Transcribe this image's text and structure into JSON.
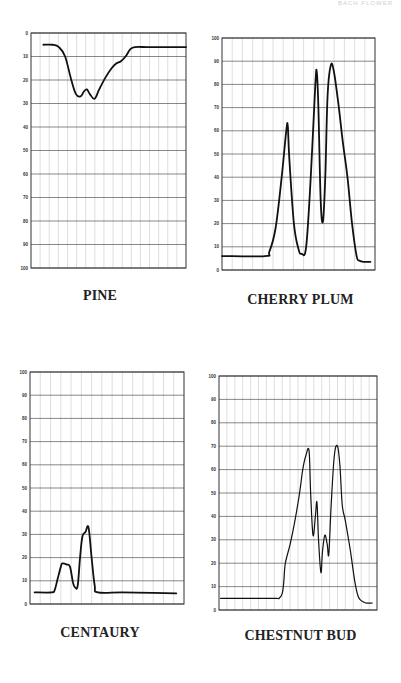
{
  "page": {
    "running_head": "BACH FLOWER"
  },
  "chart_data": [
    {
      "id": "pine",
      "type": "line",
      "title": "PINE",
      "xlabel": "",
      "ylabel": "",
      "ylim": [
        0,
        100
      ],
      "y_inverted": true,
      "y_ticks": [
        0,
        10,
        20,
        30,
        40,
        50,
        60,
        70,
        80,
        90,
        100
      ],
      "grid": true,
      "vertical_grid_columns": 17,
      "x": [
        8,
        14,
        18,
        22,
        26,
        29,
        32,
        34,
        36,
        38,
        41,
        44,
        48,
        52,
        55,
        58,
        61,
        64,
        67,
        75,
        85,
        100
      ],
      "values": [
        5,
        5,
        6,
        10,
        20,
        26,
        27,
        25,
        24,
        26,
        28,
        24,
        19,
        15,
        13,
        12,
        10,
        7,
        6,
        6,
        6,
        6
      ]
    },
    {
      "id": "cherry-plum",
      "type": "line",
      "title": "CHERRY PLUM",
      "xlabel": "",
      "ylabel": "",
      "ylim": [
        0,
        100
      ],
      "y_inverted": false,
      "y_ticks": [
        0,
        10,
        20,
        30,
        40,
        50,
        60,
        70,
        80,
        90,
        100
      ],
      "grid": true,
      "vertical_grid_columns": 15,
      "x": [
        0,
        28,
        31,
        35,
        39,
        42,
        43,
        44,
        47,
        50,
        52,
        55,
        58,
        61,
        62,
        63,
        64.5,
        66,
        67.5,
        69,
        71,
        73,
        76,
        79,
        82,
        85,
        88,
        90,
        93,
        97
      ],
      "values": [
        6,
        6,
        8,
        18,
        40,
        60,
        62,
        48,
        20,
        9,
        7,
        10,
        40,
        80,
        85,
        70,
        30,
        21,
        40,
        75,
        88,
        86,
        72,
        55,
        40,
        20,
        6,
        4,
        3.5,
        3.5
      ]
    },
    {
      "id": "centaury",
      "type": "line",
      "title": "CENTAURY",
      "xlabel": "",
      "ylabel": "",
      "ylim": [
        0,
        100
      ],
      "y_inverted": false,
      "y_ticks": [
        0,
        10,
        20,
        30,
        40,
        50,
        60,
        70,
        80,
        90,
        100
      ],
      "grid": true,
      "vertical_grid_columns": 15,
      "x": [
        3,
        14,
        16,
        18,
        20,
        21,
        24,
        26,
        28,
        29.5,
        31,
        32.5,
        34,
        36,
        38,
        40,
        42,
        44,
        60,
        80,
        95
      ],
      "values": [
        5,
        5,
        6,
        11,
        16,
        17.5,
        17,
        16,
        9,
        7,
        8,
        20,
        29,
        31,
        33,
        20,
        8,
        5,
        5,
        4.8,
        4.6
      ]
    },
    {
      "id": "chestnut-bud",
      "type": "line",
      "title": "CHESTNUT BUD",
      "xlabel": "",
      "ylabel": "",
      "ylim": [
        0,
        100
      ],
      "y_inverted": false,
      "y_ticks": [
        0,
        10,
        20,
        30,
        40,
        50,
        60,
        70,
        80,
        90,
        100
      ],
      "grid": true,
      "vertical_grid_columns": 20,
      "x": [
        1,
        20,
        36,
        38,
        40,
        41,
        42,
        45,
        48,
        51,
        53,
        55,
        57,
        58,
        59.5,
        61,
        62,
        63,
        64.5,
        65.5,
        67,
        68.5,
        69.5,
        71,
        73,
        75,
        76.5,
        78,
        80,
        83,
        86,
        88,
        90,
        93,
        97
      ],
      "values": [
        5,
        5,
        5,
        5,
        7,
        12,
        20,
        28,
        38,
        50,
        60,
        66,
        68,
        50,
        32,
        40,
        46,
        30,
        16,
        25,
        32,
        28,
        24,
        45,
        66,
        70,
        62,
        45,
        38,
        26,
        12,
        6,
        4,
        3,
        3
      ]
    }
  ]
}
